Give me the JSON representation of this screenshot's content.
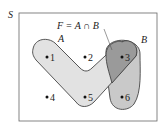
{
  "diagram": {
    "type": "venn",
    "universe_label": "S",
    "formula": "F = A ∩ B",
    "sets": [
      {
        "name": "A",
        "label": "A",
        "elements": [
          1,
          2,
          3,
          5
        ],
        "fill": "#e2e2e2"
      },
      {
        "name": "B",
        "label": "B",
        "elements": [
          3,
          6
        ],
        "fill": "#c9c9c9"
      }
    ],
    "intersection": {
      "label": "F",
      "elements": [
        3
      ],
      "fill": "#9a9a9a"
    },
    "points": [
      {
        "label": "1",
        "x": 47,
        "y": 57
      },
      {
        "label": "2",
        "x": 85,
        "y": 57
      },
      {
        "label": "3",
        "x": 122,
        "y": 57
      },
      {
        "label": "4",
        "x": 47,
        "y": 97
      },
      {
        "label": "5",
        "x": 85,
        "y": 97
      },
      {
        "label": "6",
        "x": 122,
        "y": 97
      }
    ],
    "colors": {
      "frame": "#555555",
      "outline": "#444444",
      "text": "#222222"
    }
  }
}
